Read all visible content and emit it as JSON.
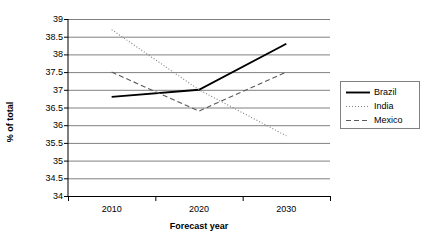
{
  "chart_data": {
    "type": "line",
    "title": "",
    "xlabel": "Forecast year",
    "ylabel": "% of total",
    "categories": [
      "2010",
      "2020",
      "2030"
    ],
    "ylim": [
      34,
      39
    ],
    "yticks": [
      39,
      38.5,
      38,
      37.5,
      37,
      36.5,
      36,
      35.5,
      35,
      34.5,
      34
    ],
    "ytick_labels": [
      "39",
      "38.5",
      "38",
      "37.5",
      "37",
      "36.5",
      "36",
      "35.5",
      "35",
      "34.5",
      "34"
    ],
    "grid": true,
    "legend_position": "right",
    "series": [
      {
        "name": "Brazil",
        "style": "solid",
        "color": "#000000",
        "values": [
          36.8,
          37.0,
          38.3
        ]
      },
      {
        "name": "India",
        "style": "dotted",
        "color": "#7f7f7f",
        "values": [
          38.7,
          37.0,
          35.7
        ]
      },
      {
        "name": "Mexico",
        "style": "dashed",
        "color": "#595959",
        "values": [
          37.5,
          36.4,
          37.5
        ]
      }
    ]
  },
  "legend": {
    "items": [
      {
        "label": "Brazil"
      },
      {
        "label": "India"
      },
      {
        "label": "Mexico"
      }
    ]
  },
  "axes": {
    "x_title": "Forecast year",
    "y_title": "% of total"
  }
}
